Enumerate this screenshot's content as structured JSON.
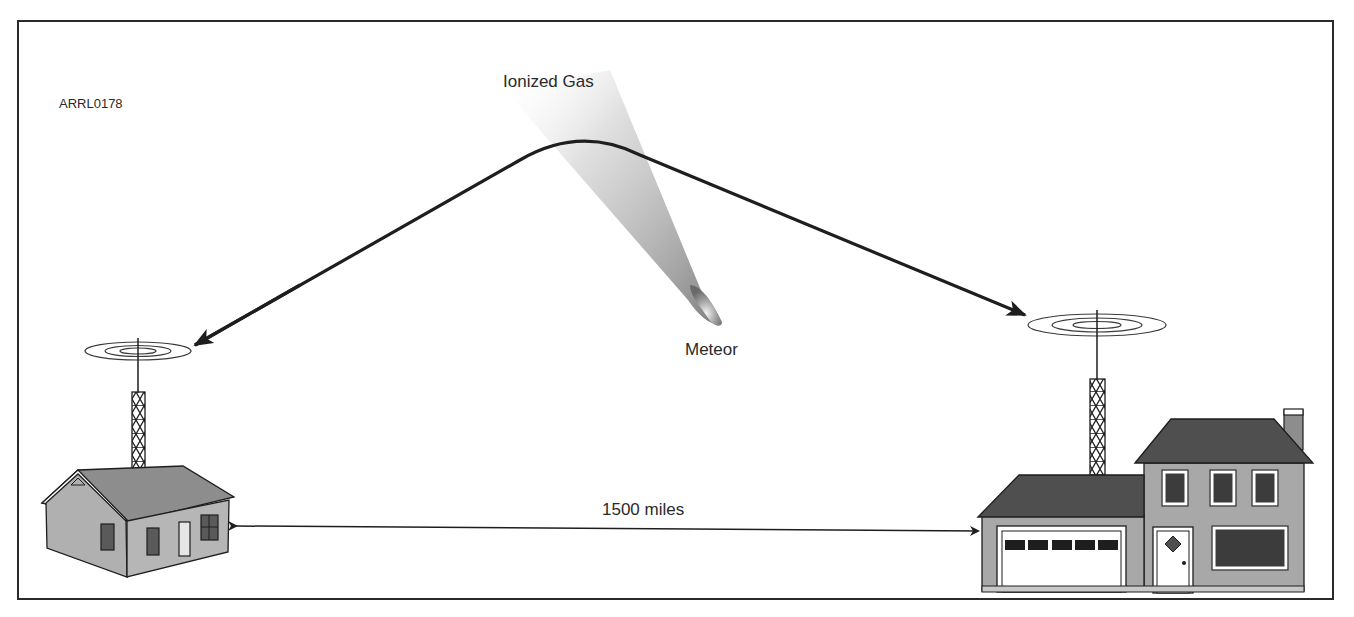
{
  "figure": {
    "id": "ARRL0178"
  },
  "labels": {
    "ionized_gas": "Ionized Gas",
    "meteor": "Meteor",
    "distance": "1500 miles"
  },
  "stations": [
    {
      "name": "left-station",
      "type": "single-story house with lattice tower and antenna"
    },
    {
      "name": "right-station",
      "type": "two-story house with attached garage, lattice tower and antenna"
    }
  ],
  "colors": {
    "line": "#1e1e1e",
    "frame": "#2a2a2a",
    "wall": "#a8a8a8",
    "wall_light": "#b9b9b9",
    "roof_light": "#8d8d8d",
    "roof_dark": "#4f4f4f",
    "window": "#3c3c3c",
    "trim": "#ffffff",
    "gas": "#9a9a9a"
  }
}
